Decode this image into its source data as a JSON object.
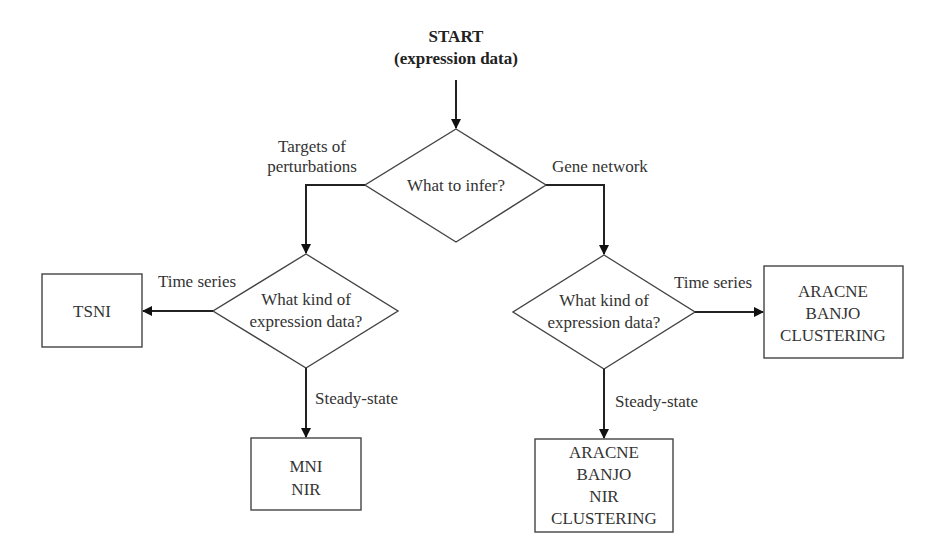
{
  "start": {
    "line1": "START",
    "line2": "(expression data)"
  },
  "decisions": {
    "top": {
      "label": "What to infer?"
    },
    "left": {
      "line1": "What kind of",
      "line2": "expression data?"
    },
    "right": {
      "line1": "What kind of",
      "line2": "expression data?"
    }
  },
  "edge_labels": {
    "targets_line1": "Targets of",
    "targets_line2": "perturbations",
    "gene_network": "Gene network",
    "left_time_series": "Time series",
    "left_steady_state": "Steady-state",
    "right_time_series": "Time series",
    "right_steady_state": "Steady-state"
  },
  "outcomes": {
    "tsni": [
      "TSNI"
    ],
    "mni_nir": [
      "MNI",
      "NIR"
    ],
    "right_time": [
      "ARACNE",
      "BANJO",
      "CLUSTERING"
    ],
    "right_steady": [
      "ARACNE",
      "BANJO",
      "NIR",
      "CLUSTERING"
    ]
  }
}
